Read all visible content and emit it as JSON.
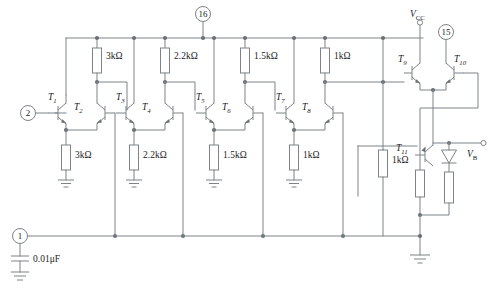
{
  "diagram": {
    "type": "electronic-circuit-schematic",
    "colors": {
      "wire": "#7d8388",
      "junction": "#6a7075",
      "text": "#1b1b1b",
      "background": "#ffffff"
    }
  },
  "pins": [
    {
      "id": "pin-16",
      "label": "16"
    },
    {
      "id": "pin-15",
      "label": "15"
    },
    {
      "id": "pin-2",
      "label": "2"
    },
    {
      "id": "pin-1",
      "label": "1"
    }
  ],
  "supply": {
    "vcc_label": "V",
    "vcc_sub": "CC"
  },
  "output": {
    "vb_label": "V",
    "vb_sub": "B"
  },
  "transistors": [
    {
      "id": "T1",
      "label": "T",
      "sub": "1"
    },
    {
      "id": "T2",
      "label": "T",
      "sub": "2"
    },
    {
      "id": "T3",
      "label": "T",
      "sub": "3"
    },
    {
      "id": "T4",
      "label": "T",
      "sub": "4"
    },
    {
      "id": "T5",
      "label": "T",
      "sub": "5"
    },
    {
      "id": "T6",
      "label": "T",
      "sub": "6"
    },
    {
      "id": "T7",
      "label": "T",
      "sub": "7"
    },
    {
      "id": "T8",
      "label": "T",
      "sub": "8"
    },
    {
      "id": "T9",
      "label": "T",
      "sub": "9"
    },
    {
      "id": "T10",
      "label": "T",
      "sub": "10"
    },
    {
      "id": "T11",
      "label": "T",
      "sub": "11"
    }
  ],
  "resistors": [
    {
      "id": "r-collector-1",
      "value": "3kΩ"
    },
    {
      "id": "r-emitter-1",
      "value": "3kΩ"
    },
    {
      "id": "r-collector-2",
      "value": "2.2kΩ"
    },
    {
      "id": "r-emitter-2",
      "value": "2.2kΩ"
    },
    {
      "id": "r-collector-3",
      "value": "1.5kΩ"
    },
    {
      "id": "r-emitter-3",
      "value": "1.5kΩ"
    },
    {
      "id": "r-collector-4",
      "value": "1kΩ"
    },
    {
      "id": "r-emitter-4",
      "value": "1kΩ"
    },
    {
      "id": "r-tail-bias",
      "value": "1kΩ"
    },
    {
      "id": "r-t11-emitter",
      "value": ""
    },
    {
      "id": "r-diode-leg",
      "value": ""
    }
  ],
  "capacitors": [
    {
      "id": "c-input",
      "value": "0.01μF"
    }
  ],
  "diodes": [
    {
      "id": "d-output-clamp",
      "value": ""
    }
  ]
}
